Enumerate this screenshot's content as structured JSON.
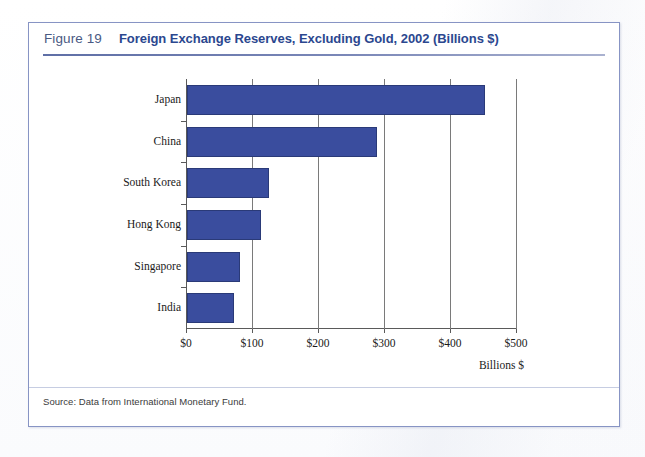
{
  "figure": {
    "number": "Figure 19",
    "title": "Foreign Exchange Reserves, Excluding Gold, 2002 (Billions $)",
    "source": "Source: Data from International Monetary Fund."
  },
  "colors": {
    "bar_fill": "#3a4d9e",
    "bar_border": "#2a3a78",
    "title": "#2b478f",
    "figure_number": "#4a5a83",
    "box_border": "#8794c4"
  },
  "chart_data": {
    "type": "bar",
    "orientation": "horizontal",
    "title": "Foreign Exchange Reserves, Excluding Gold, 2002 (Billions $)",
    "xlabel": "Billions $",
    "ylabel": "",
    "categories": [
      "Japan",
      "China",
      "South Korea",
      "Hong Kong",
      "Singapore",
      "India"
    ],
    "values": [
      451,
      288,
      124,
      112,
      80,
      71
    ],
    "xlim": [
      0,
      500
    ],
    "xticks": [
      0,
      100,
      200,
      300,
      400,
      500
    ],
    "xtick_labels": [
      "$0",
      "$100",
      "$200",
      "$300",
      "$400",
      "$500"
    ],
    "grid": "vertical",
    "legend": null,
    "series": [
      {
        "name": "Foreign exchange reserves 2002",
        "values": [
          451,
          288,
          124,
          112,
          80,
          71
        ]
      }
    ]
  }
}
